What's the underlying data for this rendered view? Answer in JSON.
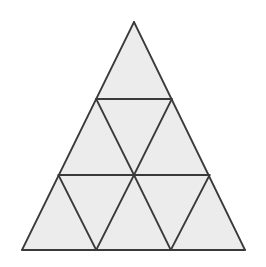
{
  "figure": {
    "name": "subdivided-equilateral-triangle",
    "title": "Equilateral triangle subdivided into smaller triangles",
    "shape_type": "triangle",
    "total_small_triangles": 9,
    "row_counts": [
      1,
      3,
      5
    ],
    "rows": [
      {
        "index": 1,
        "label": "top row",
        "count": 1,
        "orientations": [
          "up"
        ]
      },
      {
        "index": 2,
        "label": "middle row",
        "count": 3,
        "orientations": [
          "up",
          "down",
          "up"
        ]
      },
      {
        "index": 3,
        "label": "bottom row",
        "count": 5,
        "orientations": [
          "up",
          "down",
          "up",
          "down",
          "up"
        ]
      }
    ],
    "colors": {
      "background": "#ffffff",
      "fill": "#ececec",
      "stroke": "#3a3a3a"
    },
    "stroke_width": 1.8,
    "canvas": {
      "width": 266,
      "height": 267
    },
    "geometry": {
      "apex": {
        "x": 134,
        "y": 22
      },
      "base_left": {
        "x": 22,
        "y": 250
      },
      "base_right": {
        "x": 245,
        "y": 250
      },
      "center": {
        "x": 134,
        "y": 175
      },
      "upper_chord_y": 99,
      "lower_chord_y": 175,
      "upper_chord_left": {
        "x": 96.2,
        "y": 99
      },
      "upper_chord_right": {
        "x": 171.8,
        "y": 99
      },
      "lower_chord_left": {
        "x": 58.4,
        "y": 175
      },
      "lower_chord_right": {
        "x": 209.6,
        "y": 175
      },
      "base_vertex_a": {
        "x": 96.2,
        "y": 250
      },
      "base_vertex_b": {
        "x": 170.8,
        "y": 250
      }
    },
    "outline_points": "134,22 245,250 22,250",
    "faces": [
      {
        "id": "t1-top",
        "row": 1,
        "orientation": "up",
        "points": "134,22 171.8,99 96.2,99"
      },
      {
        "id": "t2-mid-left",
        "row": 2,
        "orientation": "up",
        "points": "96.2,99 134,175 58.4,175"
      },
      {
        "id": "t3-mid-center",
        "row": 2,
        "orientation": "down",
        "points": "96.2,99 171.8,99 134,175"
      },
      {
        "id": "t4-mid-right",
        "row": 2,
        "orientation": "up",
        "points": "171.8,99 209.6,175 134,175"
      },
      {
        "id": "t5-bot-1",
        "row": 3,
        "orientation": "up",
        "points": "58.4,175 96.2,250 22,250"
      },
      {
        "id": "t6-bot-2",
        "row": 3,
        "orientation": "down",
        "points": "58.4,175 134,175 96.2,250"
      },
      {
        "id": "t7-bot-3",
        "row": 3,
        "orientation": "up",
        "points": "134,175 170.8,250 96.2,250"
      },
      {
        "id": "t8-bot-4",
        "row": 3,
        "orientation": "down",
        "points": "134,175 209.6,175 170.8,250"
      },
      {
        "id": "t9-bot-5",
        "row": 3,
        "orientation": "up",
        "points": "209.6,175 245,250 170.8,250"
      }
    ],
    "lines": [
      {
        "id": "outer-left-edge",
        "kind": "outline",
        "d": "M134,22 L22,250"
      },
      {
        "id": "outer-right-edge",
        "kind": "outline",
        "d": "M134,22 L245,250"
      },
      {
        "id": "outer-base-edge",
        "kind": "outline",
        "d": "M22,250 L245,250"
      },
      {
        "id": "upper-chord",
        "kind": "horizontal",
        "d": "M96.2,99 L171.8,99"
      },
      {
        "id": "lower-chord",
        "kind": "horizontal",
        "d": "M58.4,175 L209.6,175"
      },
      {
        "id": "left-lean-upper",
        "kind": "oblique",
        "d": "M96.2,99 L134,175"
      },
      {
        "id": "right-lean-upper",
        "kind": "oblique",
        "d": "M171.8,99 L134,175"
      },
      {
        "id": "left-lean-lower-a",
        "kind": "oblique",
        "d": "M58.4,175 L96.2,250"
      },
      {
        "id": "right-lean-lower-a",
        "kind": "oblique",
        "d": "M134,175 L96.2,250"
      },
      {
        "id": "left-lean-lower-b",
        "kind": "oblique",
        "d": "M134,175 L170.8,250"
      },
      {
        "id": "right-lean-lower-b",
        "kind": "oblique",
        "d": "M209.6,175 L170.8,250"
      }
    ]
  }
}
